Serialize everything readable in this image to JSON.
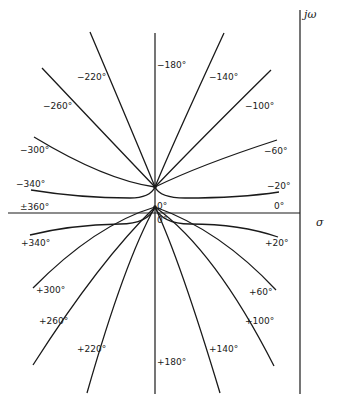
{
  "diagram": {
    "type": "root-locus-phase-contours",
    "axes": {
      "imag_label": "jω",
      "real_label": "σ"
    },
    "upper_labels": {
      "m180": "−180°",
      "m140": "−140°",
      "m100": "−100°",
      "m60": "−60°",
      "m20": "−20°",
      "zero_right": "0°",
      "m220": "−220°",
      "m260": "−260°",
      "m300": "−300°",
      "m340": "−340°",
      "pm360": "±360°",
      "zero_center": "0°"
    },
    "lower_labels": {
      "zero_center": "0°",
      "p20": "+20°",
      "p60": "+60°",
      "p100": "+100°",
      "p140": "+140°",
      "p180": "+180°",
      "p220": "+220°",
      "p260": "+260°",
      "p300": "+300°",
      "p340": "+340°"
    }
  }
}
